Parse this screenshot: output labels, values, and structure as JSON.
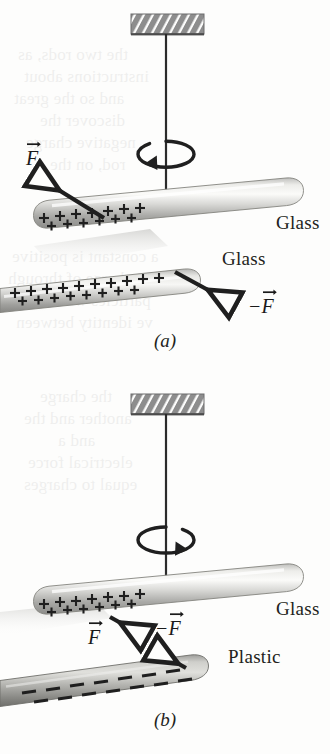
{
  "figure": {
    "domain": "physics-diagram",
    "background_color": "#fdfdfc",
    "ink_color": "#231f20"
  },
  "ghost_text": [
    {
      "text": "the two rods, as",
      "x": 18,
      "y": 44
    },
    {
      "text": "instructions about",
      "x": 24,
      "y": 66
    },
    {
      "text": "and so the great",
      "x": 14,
      "y": 88
    },
    {
      "text": "discover the",
      "x": 40,
      "y": 110
    },
    {
      "text": "negative charge",
      "x": 26,
      "y": 132
    },
    {
      "text": "rod, on the",
      "x": 50,
      "y": 154
    },
    {
      "text": "a constant is positive",
      "x": 12,
      "y": 246
    },
    {
      "text": "a 1.0 C charge of through",
      "x": 8,
      "y": 268
    },
    {
      "text": "particles with the",
      "x": 30,
      "y": 290
    },
    {
      "text": "ve identity between",
      "x": 16,
      "y": 312
    },
    {
      "text": "the charge",
      "x": 40,
      "y": 386
    },
    {
      "text": "another and the",
      "x": 24,
      "y": 408
    },
    {
      "text": "and a",
      "x": 58,
      "y": 430
    },
    {
      "text": "electrical force",
      "x": 28,
      "y": 452
    },
    {
      "text": "equal to charges",
      "x": 24,
      "y": 474
    }
  ],
  "panels": [
    {
      "id": "panel-a",
      "caption": "(a)",
      "caption_y": 330,
      "top": 0,
      "ceiling": {
        "x": 131,
        "y": 14,
        "width": 73,
        "height": 20,
        "fill": "#8d8d8d",
        "hatch": "#ffffff"
      },
      "thread": {
        "x": 166,
        "y1": 34,
        "y2": 202,
        "color": "#2b2b2b"
      },
      "rotation_arrow": {
        "cx": 166,
        "cy": 154,
        "rx": 28,
        "ry": 13,
        "direction": "counterclockwise-left"
      },
      "stirrup": {
        "x": 145,
        "y": 192,
        "width": 43,
        "height": 16
      },
      "rods": [
        {
          "name": "suspended-glass-rod",
          "material": "Glass",
          "charge": "positive",
          "label": "Glass",
          "label_x": 276,
          "label_y": 222
        },
        {
          "name": "hand-held-glass-rod",
          "material": "Glass",
          "charge": "positive",
          "label": "Glass",
          "label_x": 222,
          "label_y": 258
        }
      ],
      "forces": [
        {
          "name": "force-on-suspended-rod",
          "symbol": "F",
          "sign": "",
          "label_x": 26,
          "label_y": 157,
          "direction": "up-left",
          "meaning": "repulsion"
        },
        {
          "name": "reaction-force-on-held-rod",
          "symbol": "F",
          "sign": "−",
          "label_x": 254,
          "label_y": 305,
          "direction": "down-right",
          "meaning": "repulsion"
        }
      ]
    },
    {
      "id": "panel-b",
      "caption": "(b)",
      "caption_y": 709,
      "top": 380,
      "ceiling": {
        "x": 131,
        "y": 14,
        "width": 73,
        "height": 20,
        "fill": "#8d8d8d",
        "hatch": "#ffffff"
      },
      "thread": {
        "x": 166,
        "y1": 34,
        "y2": 208,
        "color": "#2b2b2b"
      },
      "rotation_arrow": {
        "cx": 166,
        "cy": 160,
        "rx": 28,
        "ry": 13,
        "direction": "clockwise-right"
      },
      "stirrup": {
        "x": 145,
        "y": 198,
        "width": 43,
        "height": 16
      },
      "rods": [
        {
          "name": "suspended-glass-rod",
          "material": "Glass",
          "charge": "positive",
          "label": "Glass",
          "label_x": 276,
          "label_y": 603
        },
        {
          "name": "hand-held-plastic-rod",
          "material": "Plastic",
          "charge": "negative",
          "label": "Plastic",
          "label_x": 228,
          "label_y": 652
        }
      ],
      "forces": [
        {
          "name": "force-on-suspended-rod",
          "symbol": "F",
          "sign": "",
          "label_x": 94,
          "label_y": 631,
          "direction": "down-right",
          "meaning": "attraction"
        },
        {
          "name": "reaction-force-on-held-rod",
          "symbol": "F",
          "sign": "−",
          "label_x": 158,
          "label_y": 623,
          "direction": "up-left",
          "meaning": "attraction"
        }
      ]
    }
  ],
  "charge_symbols": {
    "positive": "+",
    "negative": "−"
  },
  "colors": {
    "rod_light": "#f4f4f2",
    "rod_mid": "#c9c9c7",
    "rod_dark": "#8e8e8c",
    "plastic_dark": "#6f6f6d",
    "ink": "#231f20",
    "arrow": "#2b2b2b",
    "ceiling": "#8d8d8d"
  }
}
